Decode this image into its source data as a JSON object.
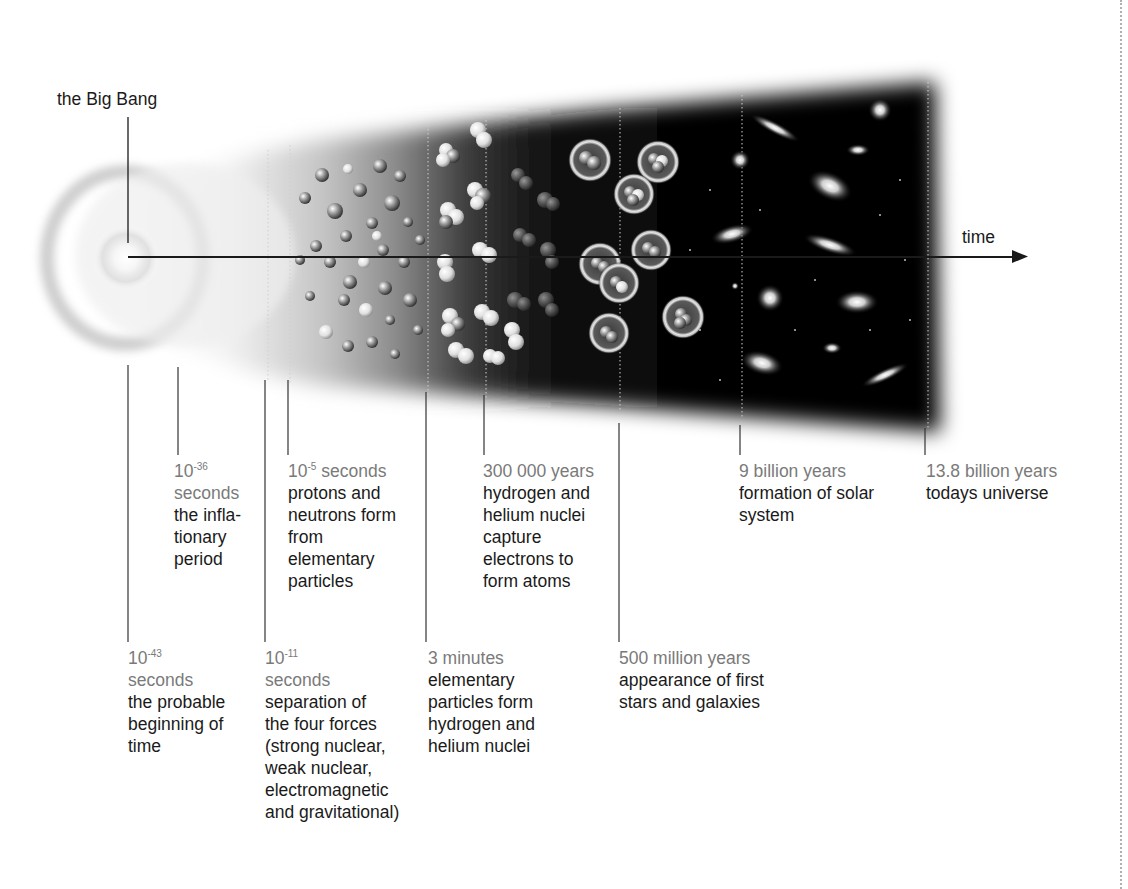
{
  "figure": {
    "title_label": "the Big Bang",
    "axis_label": "time",
    "colors": {
      "text_primary": "#1a1a1a",
      "text_time": "#7a7a7a",
      "cone_dark": "#050505",
      "background": "#ffffff"
    }
  },
  "events": [
    {
      "id": "planck",
      "time_base": "10",
      "time_exp": "-43",
      "time_unit": "seconds",
      "description": [
        "the probable",
        "beginning of",
        "time"
      ],
      "row": "lower",
      "x": 128
    },
    {
      "id": "inflation",
      "time_base": "10",
      "time_exp": "-36",
      "time_unit": "seconds",
      "description": [
        "the infla-",
        "tionary",
        "period"
      ],
      "row": "upper",
      "x": 178
    },
    {
      "id": "forces",
      "time_base": "10",
      "time_exp": "-11",
      "time_unit": "seconds",
      "description": [
        "separation of",
        "the four forces",
        "(strong nuclear,",
        "weak nuclear,",
        "electromagnetic",
        "and gravitational)"
      ],
      "row": "lower",
      "x": 265
    },
    {
      "id": "hadrons",
      "time_base": "10",
      "time_exp": "-5",
      "time_unit": "seconds",
      "description": [
        "protons and",
        "neutrons form",
        "from",
        "elementary",
        "particles"
      ],
      "row": "upper",
      "x": 288
    },
    {
      "id": "nucleosynthesis",
      "time_text": "3 minutes",
      "description": [
        "elementary",
        "particles form",
        "hydrogen and",
        "helium nuclei"
      ],
      "row": "lower",
      "x": 426
    },
    {
      "id": "recombination",
      "time_text": "300 000 years",
      "description": [
        "hydrogen and",
        "helium nuclei",
        "capture",
        "electrons to",
        "form atoms"
      ],
      "row": "upper",
      "x": 484
    },
    {
      "id": "first_stars",
      "time_text": "500 million years",
      "description": [
        "appearance of first",
        "stars and galaxies"
      ],
      "row": "lower",
      "x": 619
    },
    {
      "id": "solar_system",
      "time_text": "9 billion years",
      "description": [
        "formation of solar",
        "system"
      ],
      "row": "upper",
      "x": 740
    },
    {
      "id": "today",
      "time_text": "13.8 billion years",
      "description": [
        "todays universe"
      ],
      "row": "upper",
      "x": 925
    }
  ]
}
